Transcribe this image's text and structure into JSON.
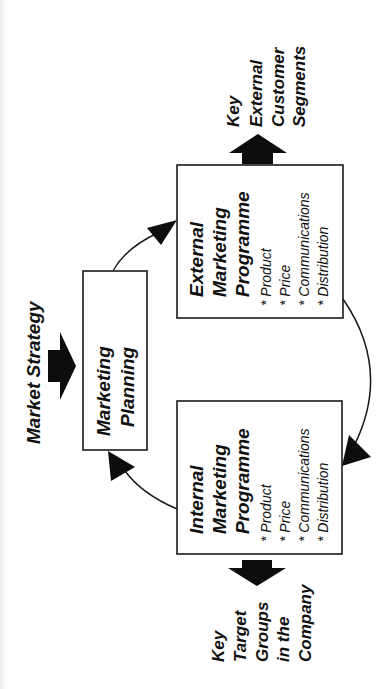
{
  "diagram": {
    "orientation": "rotated -90deg",
    "input": {
      "label": "Market Strategy"
    },
    "planning": {
      "title_lines": [
        "Marketing",
        "Planning"
      ]
    },
    "external_programme": {
      "title_lines": [
        "External",
        "Marketing",
        "Programme"
      ],
      "bullets": [
        "* Product",
        "* Price",
        "* Communications",
        "* Distribution"
      ]
    },
    "internal_programme": {
      "title_lines": [
        "Internal",
        "Marketing",
        "Programme"
      ],
      "bullets": [
        "* Product",
        "* Price",
        "* Communications",
        "* Distribution"
      ]
    },
    "external_output": {
      "label_lines": [
        "Key",
        "External",
        "Customer",
        "Segments"
      ]
    },
    "internal_output": {
      "label_lines": [
        "Key",
        "Target",
        "Groups",
        "in the",
        "Company"
      ]
    },
    "flows": [
      {
        "from": "Market Strategy",
        "to": "Marketing Planning",
        "type": "block-arrow"
      },
      {
        "from": "Marketing Planning",
        "to": "External Marketing Programme",
        "type": "curved-arrow"
      },
      {
        "from": "External Marketing Programme",
        "to": "Internal Marketing Programme",
        "type": "curved-arrow"
      },
      {
        "from": "Internal Marketing Programme",
        "to": "Marketing Planning",
        "type": "curved-arrow"
      },
      {
        "from": "External Marketing Programme",
        "to": "Key External Customer Segments",
        "type": "block-arrow"
      },
      {
        "from": "Internal Marketing Programme",
        "to": "Key Target Groups in the Company",
        "type": "block-arrow"
      }
    ],
    "colors": {
      "background": "#ffffff",
      "ink": "#111111"
    }
  }
}
